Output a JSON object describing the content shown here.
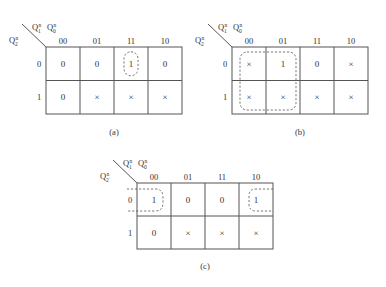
{
  "figure": {
    "maps": [
      {
        "id": "a",
        "caption": "(a)",
        "col_var": "Q1n Q0n",
        "row_var": "Q2n",
        "col_headers": [
          "00",
          "01",
          "11",
          "10"
        ],
        "row_headers": [
          "0",
          "1"
        ],
        "cells": [
          [
            "0",
            "0",
            "1",
            "0"
          ],
          [
            "0",
            "×",
            "×",
            "×"
          ]
        ],
        "groups": [
          {
            "description": "single cell loop around the 1",
            "cells": [
              [
                0,
                2
              ]
            ]
          }
        ]
      },
      {
        "id": "b",
        "caption": "(b)",
        "col_var": "Q1n Q0n",
        "row_var": "Q2n",
        "col_headers": [
          "00",
          "01",
          "11",
          "10"
        ],
        "row_headers": [
          "0",
          "1"
        ],
        "cells": [
          [
            "×",
            "1",
            "0",
            "×"
          ],
          [
            "×",
            "×",
            "×",
            "×"
          ]
        ],
        "groups": [
          {
            "description": "2x2 loop covering columns 00,01 both rows",
            "cells": [
              [
                0,
                0
              ],
              [
                0,
                1
              ],
              [
                1,
                0
              ],
              [
                1,
                1
              ]
            ]
          }
        ]
      },
      {
        "id": "c",
        "caption": "(c)",
        "col_var": "Q1n Q0n",
        "row_var": "Q2n",
        "col_headers": [
          "00",
          "01",
          "11",
          "10"
        ],
        "row_headers": [
          "0",
          "1"
        ],
        "cells": [
          [
            "1",
            "0",
            "0",
            "1"
          ],
          [
            "0",
            "×",
            "×",
            "×"
          ]
        ],
        "groups": [
          {
            "description": "wrap-around loop joining columns 00 and 10 in row 0",
            "cells": [
              [
                0,
                0
              ],
              [
                0,
                3
              ]
            ]
          }
        ]
      }
    ],
    "labels": {
      "Q": "Q",
      "n": "n",
      "sub1": "1",
      "sub0": "0",
      "sub2": "2"
    }
  }
}
